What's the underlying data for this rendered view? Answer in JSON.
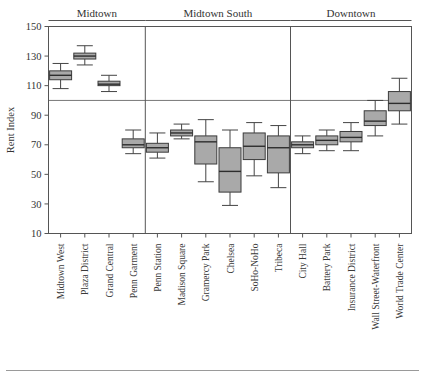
{
  "chart_data": {
    "type": "box",
    "title": "",
    "xlabel": "",
    "ylabel": "Rent Index",
    "ylim": [
      10,
      150
    ],
    "yticks": [
      10,
      30,
      50,
      70,
      90,
      110,
      130,
      150
    ],
    "grid": false,
    "reference_line": 100,
    "legend": "none",
    "panel_groups": [
      {
        "label": "Midtown",
        "categories": [
          "Midtown  West",
          "Plaza District",
          "Grand Central",
          "Penn Garment"
        ]
      },
      {
        "label": "Midtown South",
        "categories": [
          "Penn Station",
          "Madison Square",
          "Gramercy Park",
          "Chelsea",
          "SoHo-NoHo",
          "Tribeca"
        ]
      },
      {
        "label": "Downtown",
        "categories": [
          "City Hall",
          "Battery Park",
          "Insurance District",
          "Wall Street-Waterfront",
          "World Trade Center"
        ]
      }
    ],
    "categories": [
      "Midtown  West",
      "Plaza District",
      "Grand Central",
      "Penn Garment",
      "Penn Station",
      "Madison Square",
      "Gramercy Park",
      "Chelsea",
      "SoHo-NoHo",
      "Tribeca",
      "City Hall",
      "Battery Park",
      "Insurance District",
      "Wall Street-Waterfront",
      "World Trade Center"
    ],
    "boxes": [
      {
        "category": "Midtown  West",
        "group": "Midtown",
        "min": 108,
        "q1": 114,
        "median": 117,
        "q3": 120,
        "max": 125
      },
      {
        "category": "Plaza District",
        "group": "Midtown",
        "min": 124,
        "q1": 128,
        "median": 130,
        "q3": 132,
        "max": 137
      },
      {
        "category": "Grand Central",
        "group": "Midtown",
        "min": 106,
        "q1": 110,
        "median": 111,
        "q3": 113,
        "max": 117
      },
      {
        "category": "Penn Garment",
        "group": "Midtown",
        "min": 64,
        "q1": 68,
        "median": 70,
        "q3": 74,
        "max": 80
      },
      {
        "category": "Penn Station",
        "group": "Midtown South",
        "min": 61,
        "q1": 65,
        "median": 68,
        "q3": 71,
        "max": 78
      },
      {
        "category": "Madison Square",
        "group": "Midtown South",
        "min": 74,
        "q1": 76,
        "median": 78,
        "q3": 80,
        "max": 84
      },
      {
        "category": "Gramercy Park",
        "group": "Midtown South",
        "min": 45,
        "q1": 57,
        "median": 72,
        "q3": 76,
        "max": 87
      },
      {
        "category": "Chelsea",
        "group": "Midtown South",
        "min": 29,
        "q1": 38,
        "median": 52,
        "q3": 68,
        "max": 80
      },
      {
        "category": "SoHo-NoHo",
        "group": "Midtown South",
        "min": 49,
        "q1": 60,
        "median": 69,
        "q3": 78,
        "max": 85
      },
      {
        "category": "Tribeca",
        "group": "Midtown South",
        "min": 41,
        "q1": 51,
        "median": 68,
        "q3": 76,
        "max": 83
      },
      {
        "category": "City Hall",
        "group": "Downtown",
        "min": 64,
        "q1": 68,
        "median": 70,
        "q3": 72,
        "max": 76
      },
      {
        "category": "Battery Park",
        "group": "Downtown",
        "min": 66,
        "q1": 70,
        "median": 73,
        "q3": 76,
        "max": 80
      },
      {
        "category": "Insurance District",
        "group": "Downtown",
        "min": 66,
        "q1": 72,
        "median": 75,
        "q3": 79,
        "max": 85
      },
      {
        "category": "Wall Street-Waterfront",
        "group": "Downtown",
        "min": 76,
        "q1": 83,
        "median": 86,
        "q3": 93,
        "max": 100
      },
      {
        "category": "World Trade Center",
        "group": "Downtown",
        "min": 84,
        "q1": 93,
        "median": 98,
        "q3": 106,
        "max": 115
      }
    ],
    "colors": {
      "box_fill": "#a9a9a9",
      "box_stroke": "#3b3b3b",
      "median": "#2d2d2d",
      "frame": "#555555",
      "reference_line": "#777777",
      "background": "#ffffff",
      "text": "#333333"
    }
  }
}
